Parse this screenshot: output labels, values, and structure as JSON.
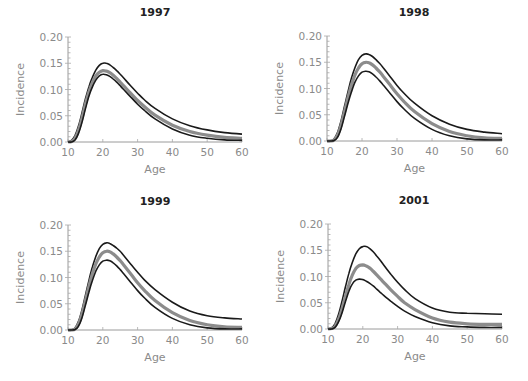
{
  "figure": {
    "ylabel": "Incidence",
    "xlabel": "Age",
    "xticks": [
      "10",
      "20",
      "30",
      "40",
      "50",
      "60"
    ],
    "yticks": [
      "0.00",
      "0.05",
      "0.10",
      "0.15",
      "0.20"
    ],
    "colors": {
      "bounds": "#1a1a1a",
      "mean": "#8c8c8c",
      "axis": "#9a9a9a",
      "tick_text": "#8a8a8a"
    }
  },
  "chart_data": [
    {
      "type": "line",
      "title": "1997",
      "xlabel": "Age",
      "ylabel": "Incidence",
      "xlim": [
        10,
        60
      ],
      "ylim": [
        0,
        0.2
      ],
      "x": [
        10,
        11,
        12,
        13,
        14,
        15,
        16,
        17,
        18,
        19,
        20,
        21,
        22,
        23,
        24,
        25,
        26,
        28,
        30,
        32,
        35,
        40,
        45,
        50,
        55,
        60
      ],
      "series": [
        {
          "name": "upper",
          "values": [
            0.0,
            0.003,
            0.012,
            0.03,
            0.055,
            0.082,
            0.105,
            0.123,
            0.137,
            0.146,
            0.15,
            0.15,
            0.147,
            0.142,
            0.136,
            0.129,
            0.122,
            0.107,
            0.093,
            0.08,
            0.064,
            0.044,
            0.031,
            0.023,
            0.018,
            0.015
          ]
        },
        {
          "name": "mean",
          "values": [
            0.0,
            0.001,
            0.007,
            0.022,
            0.045,
            0.072,
            0.095,
            0.113,
            0.126,
            0.133,
            0.136,
            0.135,
            0.132,
            0.127,
            0.121,
            0.114,
            0.107,
            0.093,
            0.079,
            0.067,
            0.051,
            0.032,
            0.02,
            0.013,
            0.009,
            0.007
          ]
        },
        {
          "name": "lower",
          "values": [
            0.0,
            0.0,
            0.004,
            0.016,
            0.037,
            0.063,
            0.087,
            0.105,
            0.118,
            0.126,
            0.129,
            0.128,
            0.125,
            0.12,
            0.114,
            0.107,
            0.1,
            0.086,
            0.072,
            0.06,
            0.044,
            0.025,
            0.013,
            0.007,
            0.004,
            0.003
          ]
        }
      ]
    },
    {
      "type": "line",
      "title": "1998",
      "xlabel": "Age",
      "ylabel": "Incidence",
      "xlim": [
        10,
        60
      ],
      "ylim": [
        0,
        0.2
      ],
      "x": [
        10,
        11,
        12,
        13,
        14,
        15,
        16,
        17,
        18,
        19,
        20,
        21,
        22,
        23,
        24,
        25,
        26,
        28,
        30,
        32,
        35,
        40,
        45,
        50,
        55,
        60
      ],
      "series": [
        {
          "name": "upper",
          "values": [
            0.0,
            0.0,
            0.004,
            0.016,
            0.038,
            0.066,
            0.094,
            0.12,
            0.14,
            0.155,
            0.163,
            0.166,
            0.165,
            0.161,
            0.155,
            0.148,
            0.14,
            0.123,
            0.106,
            0.091,
            0.072,
            0.048,
            0.032,
            0.022,
            0.017,
            0.014
          ]
        },
        {
          "name": "mean",
          "values": [
            0.0,
            0.0,
            0.002,
            0.011,
            0.03,
            0.056,
            0.083,
            0.107,
            0.126,
            0.139,
            0.147,
            0.15,
            0.149,
            0.145,
            0.139,
            0.132,
            0.124,
            0.107,
            0.09,
            0.075,
            0.056,
            0.033,
            0.018,
            0.01,
            0.006,
            0.005
          ]
        },
        {
          "name": "lower",
          "values": [
            0.0,
            0.0,
            0.001,
            0.007,
            0.023,
            0.047,
            0.072,
            0.094,
            0.112,
            0.124,
            0.131,
            0.133,
            0.132,
            0.128,
            0.122,
            0.115,
            0.107,
            0.091,
            0.075,
            0.061,
            0.043,
            0.022,
            0.01,
            0.004,
            0.002,
            0.002
          ]
        }
      ]
    },
    {
      "type": "line",
      "title": "1999",
      "xlabel": "Age",
      "ylabel": "Incidence",
      "xlim": [
        10,
        60
      ],
      "ylim": [
        0,
        0.2
      ],
      "x": [
        10,
        11,
        12,
        13,
        14,
        15,
        16,
        17,
        18,
        19,
        20,
        21,
        22,
        23,
        24,
        25,
        26,
        28,
        30,
        32,
        35,
        40,
        45,
        50,
        55,
        60
      ],
      "series": [
        {
          "name": "upper",
          "values": [
            0.0,
            0.0,
            0.004,
            0.016,
            0.038,
            0.066,
            0.094,
            0.12,
            0.14,
            0.155,
            0.163,
            0.166,
            0.165,
            0.161,
            0.156,
            0.15,
            0.142,
            0.126,
            0.11,
            0.095,
            0.077,
            0.053,
            0.036,
            0.027,
            0.023,
            0.021
          ]
        },
        {
          "name": "mean",
          "values": [
            0.0,
            0.0,
            0.002,
            0.011,
            0.03,
            0.056,
            0.083,
            0.107,
            0.126,
            0.139,
            0.147,
            0.15,
            0.149,
            0.145,
            0.139,
            0.132,
            0.124,
            0.107,
            0.09,
            0.075,
            0.056,
            0.033,
            0.018,
            0.01,
            0.006,
            0.005
          ]
        },
        {
          "name": "lower",
          "values": [
            0.0,
            0.0,
            0.001,
            0.007,
            0.023,
            0.047,
            0.072,
            0.094,
            0.112,
            0.124,
            0.131,
            0.133,
            0.132,
            0.128,
            0.122,
            0.115,
            0.107,
            0.091,
            0.075,
            0.061,
            0.043,
            0.022,
            0.01,
            0.004,
            0.002,
            0.002
          ]
        }
      ]
    },
    {
      "type": "line",
      "title": "2001",
      "xlabel": "Age",
      "ylabel": "Incidence",
      "xlim": [
        10,
        60
      ],
      "ylim": [
        0,
        0.2
      ],
      "x": [
        10,
        11,
        12,
        13,
        14,
        15,
        16,
        17,
        18,
        19,
        20,
        21,
        22,
        23,
        24,
        25,
        26,
        28,
        30,
        32,
        35,
        40,
        45,
        50,
        55,
        60
      ],
      "series": [
        {
          "name": "upper",
          "values": [
            0.0,
            0.002,
            0.01,
            0.027,
            0.052,
            0.08,
            0.106,
            0.127,
            0.143,
            0.153,
            0.157,
            0.157,
            0.153,
            0.147,
            0.139,
            0.131,
            0.122,
            0.105,
            0.089,
            0.075,
            0.058,
            0.04,
            0.032,
            0.03,
            0.029,
            0.028
          ]
        },
        {
          "name": "mean",
          "values": [
            0.0,
            0.001,
            0.005,
            0.018,
            0.038,
            0.062,
            0.085,
            0.103,
            0.115,
            0.121,
            0.122,
            0.12,
            0.116,
            0.11,
            0.103,
            0.096,
            0.089,
            0.075,
            0.062,
            0.05,
            0.037,
            0.021,
            0.013,
            0.01,
            0.009,
            0.009
          ]
        },
        {
          "name": "lower",
          "values": [
            0.0,
            0.0,
            0.003,
            0.013,
            0.03,
            0.052,
            0.072,
            0.086,
            0.093,
            0.095,
            0.094,
            0.091,
            0.087,
            0.082,
            0.076,
            0.07,
            0.064,
            0.053,
            0.043,
            0.034,
            0.024,
            0.012,
            0.006,
            0.004,
            0.003,
            0.003
          ]
        }
      ]
    }
  ],
  "panels_layout": [
    {
      "x0": 68,
      "x1": 242,
      "y0": 142,
      "y1": 37,
      "title_x": 155,
      "title_y": 16
    },
    {
      "x0": 327,
      "x1": 502,
      "y0": 141,
      "y1": 36,
      "title_x": 414,
      "title_y": 16
    },
    {
      "x0": 68,
      "x1": 242,
      "y0": 330,
      "y1": 225,
      "title_x": 155,
      "title_y": 205
    },
    {
      "x0": 328,
      "x1": 502,
      "y0": 329,
      "y1": 224,
      "title_x": 414,
      "title_y": 204
    }
  ]
}
